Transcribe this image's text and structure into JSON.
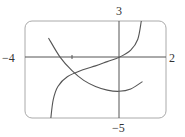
{
  "chart_data": {
    "type": "line",
    "title": "",
    "xlabel": "",
    "ylabel": "",
    "xlim": [
      -4,
      2
    ],
    "ylim": [
      -5,
      3
    ],
    "tick_labels": {
      "x_min": "−4",
      "x_max": "2",
      "y_max": "3",
      "y_min": "−5"
    },
    "grid": false,
    "legend": null,
    "series": [
      {
        "name": "decreasing convex curve",
        "x": [
          -3.0,
          -2.5,
          -2.0,
          -1.5,
          -1.0,
          -0.5,
          0.0,
          0.5,
          1.0
        ],
        "y": [
          1.6,
          0.0,
          -1.1,
          -1.9,
          -2.4,
          -2.7,
          -2.8,
          -2.6,
          -2.0
        ]
      },
      {
        "name": "increasing tan-like curve",
        "x": [
          -2.9,
          -2.8,
          -2.6,
          -2.2,
          -1.5,
          -1.0,
          -0.5,
          0.0,
          0.5,
          0.8,
          0.95
        ],
        "y": [
          -5.0,
          -3.5,
          -2.4,
          -1.6,
          -1.0,
          -0.7,
          -0.35,
          0.0,
          0.6,
          1.5,
          3.0
        ]
      }
    ],
    "colors": {
      "curve": "#555555",
      "axis": "#555555",
      "frame": "#999999"
    }
  }
}
